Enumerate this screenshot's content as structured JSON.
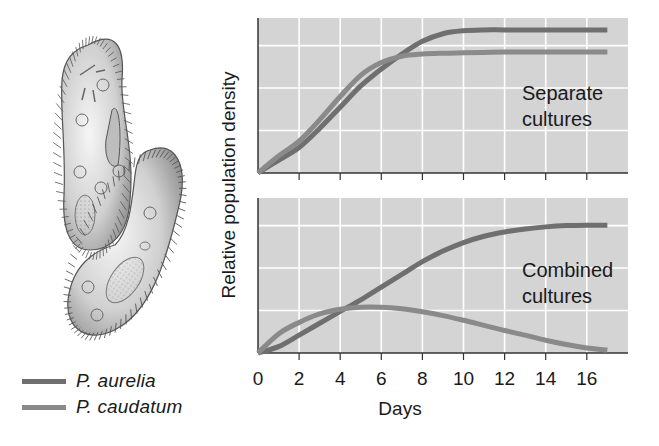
{
  "legend": {
    "items": [
      {
        "label": "P. aurelia",
        "color": "#6f6f6f"
      },
      {
        "label": "P. caudatum",
        "color": "#8a8a8a"
      }
    ]
  },
  "illustration": {
    "subject": "paramecium-cells"
  },
  "axes": {
    "ylabel": "Relative population density",
    "xlabel": "Days",
    "xticks": [
      "0",
      "2",
      "4",
      "6",
      "8",
      "10",
      "12",
      "14",
      "16"
    ]
  },
  "colors": {
    "plot_background": "#d4d4d4",
    "gridline": "#ffffff",
    "axis": "#333333",
    "line": "#6f6f6f"
  },
  "chart_data": [
    {
      "type": "line",
      "title": "Separate cultures",
      "xlabel": "Days",
      "ylabel": "Relative population density",
      "xlim": [
        0,
        17.5
      ],
      "ylim": [
        0,
        3.65
      ],
      "grid": true,
      "legend_position": "bottom-left (outside)",
      "series": [
        {
          "name": "P. aurelia",
          "x": [
            0,
            1,
            2,
            3,
            4,
            5,
            6,
            7,
            8,
            9,
            10,
            11,
            12,
            14,
            16,
            17
          ],
          "values": [
            0,
            0.3,
            0.6,
            1.05,
            1.55,
            2.05,
            2.45,
            2.8,
            3.1,
            3.28,
            3.35,
            3.37,
            3.37,
            3.37,
            3.37,
            3.37
          ]
        },
        {
          "name": "P. caudatum",
          "x": [
            0,
            1,
            2,
            3,
            4,
            5,
            6,
            7,
            8,
            9,
            10,
            11,
            12,
            14,
            16,
            17
          ],
          "values": [
            0,
            0.4,
            0.75,
            1.25,
            1.8,
            2.3,
            2.6,
            2.75,
            2.8,
            2.82,
            2.83,
            2.84,
            2.85,
            2.85,
            2.85,
            2.85
          ]
        }
      ]
    },
    {
      "type": "line",
      "title": "Combined cultures",
      "xlabel": "Days",
      "ylabel": "Relative population density",
      "xlim": [
        0,
        17.5
      ],
      "ylim": [
        0,
        3.65
      ],
      "grid": true,
      "legend_position": "bottom-left (outside)",
      "series": [
        {
          "name": "P. aurelia",
          "x": [
            0,
            1,
            2,
            3,
            4,
            5,
            6,
            7,
            8,
            9,
            10,
            11,
            12,
            13,
            14,
            15,
            16,
            17
          ],
          "values": [
            0,
            0.15,
            0.42,
            0.7,
            0.98,
            1.25,
            1.55,
            1.85,
            2.15,
            2.4,
            2.6,
            2.75,
            2.85,
            2.92,
            2.97,
            3.0,
            3.01,
            3.01
          ]
        },
        {
          "name": "P. caudatum",
          "x": [
            0,
            1,
            2,
            3,
            4,
            5,
            6,
            7,
            8,
            9,
            10,
            11,
            12,
            13,
            14,
            15,
            16,
            17
          ],
          "values": [
            0,
            0.45,
            0.72,
            0.92,
            1.03,
            1.08,
            1.08,
            1.04,
            0.97,
            0.88,
            0.77,
            0.65,
            0.53,
            0.42,
            0.3,
            0.2,
            0.12,
            0.07
          ]
        }
      ]
    }
  ]
}
